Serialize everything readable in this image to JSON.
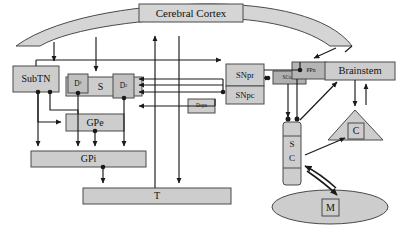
{
  "diagram": {
    "style": {
      "fill_light": "#d5d5d5",
      "fill_mid": "#c8c8c8",
      "fill_dark": "#b0b0b0",
      "stroke": "#4a4a4a",
      "arrow": "#1a1a1a",
      "background": "#ffffff"
    },
    "nodes": {
      "cerebral_cortex": {
        "label": "Cerebral Cortex",
        "shape": "arc-band-with-box"
      },
      "subtn": {
        "label": "SubTN",
        "shape": "rect"
      },
      "striatum": {
        "label": "S",
        "shape": "rect"
      },
      "d1": {
        "label": "D",
        "subscript": "1",
        "shape": "rect"
      },
      "d2": {
        "label": "D",
        "subscript": "2",
        "shape": "rect"
      },
      "gpe": {
        "label": "GPe",
        "shape": "rect"
      },
      "gpi": {
        "label": "GPi",
        "shape": "rect"
      },
      "thalamus": {
        "label": "T",
        "shape": "rect"
      },
      "snpr": {
        "label": "SNpr",
        "shape": "rect"
      },
      "snpc": {
        "label": "SNpc",
        "shape": "rect"
      },
      "dopa": {
        "label": "Dopa",
        "shape": "rect"
      },
      "sco": {
        "label": "SCo",
        "shape": "rect"
      },
      "ppn": {
        "label": "PPn",
        "shape": "rect"
      },
      "brainstem": {
        "label": "Brainstem",
        "shape": "rect"
      },
      "superior_colliculus": {
        "label_top": "S",
        "label_bottom": "C",
        "shape": "vertical-column"
      },
      "cerebellum": {
        "label": "C",
        "shape": "triangle-with-box"
      },
      "muscle": {
        "label": "M",
        "shape": "ellipse-with-box"
      }
    }
  }
}
